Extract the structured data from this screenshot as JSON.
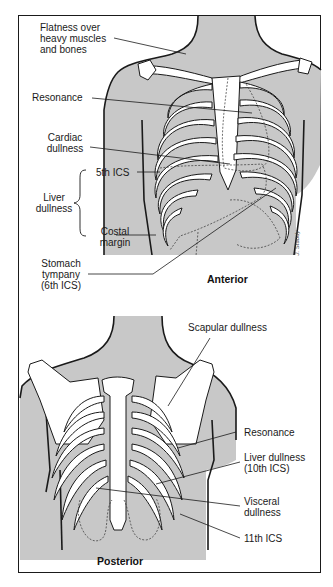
{
  "figure": {
    "panels": [
      {
        "id": "anterior",
        "title": "Anterior",
        "labels": {
          "flatness": [
            "Flatness over",
            "heavy muscles",
            "and bones"
          ],
          "resonance": "Resonance",
          "cardiac": [
            "Cardiac",
            "dullness"
          ],
          "fifth_ics": "5th ICS",
          "liver": [
            "Liver",
            "dullness"
          ],
          "costal": [
            "Costal",
            "margin"
          ],
          "stomach": [
            "Stomach",
            "tympany",
            "(6th ICS)"
          ]
        },
        "signature": "J. Staudy"
      },
      {
        "id": "posterior",
        "title": "Posterior",
        "labels": {
          "scapular": "Scapular dullness",
          "resonance": "Resonance",
          "liver": [
            "Liver dullness",
            "(10th ICS)"
          ],
          "visceral": [
            "Visceral",
            "dullness"
          ],
          "eleventh_ics": "11th ICS"
        }
      }
    ],
    "colors": {
      "shade": "#c8c8c8",
      "bone": "#ffffff",
      "line": "#1a1a1a",
      "frame": "#1a1a1a"
    }
  }
}
